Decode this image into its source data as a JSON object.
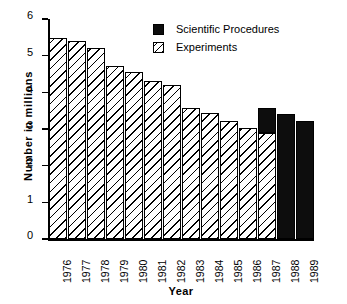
{
  "chart_data": {
    "type": "bar",
    "title": "",
    "subtitle": "",
    "xlabel": "Year",
    "ylabel": "Number  in  millions",
    "categories": [
      "1976",
      "1977",
      "1978",
      "1979",
      "1980",
      "1981",
      "1982",
      "1983",
      "1984",
      "1985",
      "1986",
      "1987",
      "1988",
      "1989"
    ],
    "ylim": [
      0,
      6
    ],
    "yticks": [
      "0",
      "1",
      "2",
      "3",
      "4",
      "5",
      "6"
    ],
    "grid": false,
    "legend_position": "top-right",
    "stacked": true,
    "series": [
      {
        "name": "Experiments",
        "fill": "hatched-diagonal",
        "color": "#000000",
        "values": [
          5.48,
          5.4,
          5.2,
          4.72,
          4.55,
          4.32,
          4.2,
          3.58,
          3.45,
          3.21,
          3.04,
          2.88,
          0,
          0
        ]
      },
      {
        "name": "Scientific Procedures",
        "fill": "solid",
        "color": "#0d0d0d",
        "values": [
          0,
          0,
          0,
          0,
          0,
          0,
          0,
          0,
          0,
          0,
          0,
          0.7,
          3.41,
          3.22
        ]
      }
    ],
    "totals": [
      5.48,
      5.4,
      5.2,
      4.72,
      4.55,
      4.32,
      4.2,
      3.58,
      3.45,
      3.21,
      3.04,
      3.58,
      3.41,
      3.22
    ],
    "annotations": []
  },
  "legend": {
    "items": [
      {
        "label": "Scientific Procedures",
        "swatch": "solid-black-square"
      },
      {
        "label": "Experiments",
        "swatch": "hatched-square"
      }
    ]
  },
  "colors": {
    "solid": "#0d0d0d",
    "outline": "#000000",
    "background": "#ffffff"
  }
}
